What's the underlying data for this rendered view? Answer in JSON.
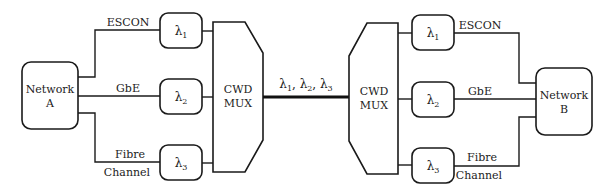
{
  "diagram": {
    "type": "cwdm-network",
    "network_a": {
      "line1": "Network",
      "line2": "A"
    },
    "network_b": {
      "line1": "Network",
      "line2": "B"
    },
    "mux_left": {
      "line1": "CWD",
      "line2": "MUX"
    },
    "mux_right": {
      "line1": "CWD",
      "line2": "MUX"
    },
    "trunk_label": "λ1, λ2, λ3",
    "trunk_parts": [
      {
        "sym": "λ",
        "sub": "1",
        "sep": ", "
      },
      {
        "sym": "λ",
        "sub": "2",
        "sep": ", "
      },
      {
        "sym": "λ",
        "sub": "3",
        "sep": ""
      }
    ],
    "channels": [
      {
        "id": "1",
        "sym": "λ",
        "sub": "1",
        "label_top": "ESCON",
        "label_bottom": ""
      },
      {
        "id": "2",
        "sym": "λ",
        "sub": "2",
        "label_top": "GbE",
        "label_bottom": ""
      },
      {
        "id": "3",
        "sym": "λ",
        "sub": "3",
        "label_top": "Fibre",
        "label_bottom": "Channel"
      }
    ],
    "colors": {
      "stroke": "#1a1a1a",
      "text": "#222222",
      "background": "#ffffff"
    }
  }
}
